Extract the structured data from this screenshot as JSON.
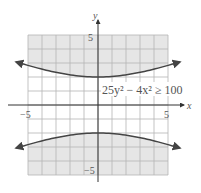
{
  "chart_data": {
    "type": "area",
    "title": "",
    "inequality": "25y² − 4x² ≥ 100",
    "equation_label": "25y² − 4x² ≥ 100",
    "curve": "hyperbola",
    "standard_form": "y²/4 − x²/25 ≥ 1",
    "vertices": [
      [
        0,
        2
      ],
      [
        0,
        -2
      ]
    ],
    "shaded_region": "above upper branch and below lower branch",
    "xlabel": "x",
    "ylabel": "y",
    "xlim": [
      -5,
      5
    ],
    "ylim": [
      -5,
      5
    ],
    "x_ticks_labeled": [
      "−5",
      "5"
    ],
    "y_ticks_labeled": [
      "5",
      "−5"
    ],
    "grid": true,
    "grid_step": 1,
    "colors": {
      "shade": "#e6e6e6",
      "grid": "#b4b4b4",
      "curve": "#444444",
      "axis": "#333333"
    }
  },
  "axes": {
    "x_label": "x",
    "y_label": "y",
    "x_min_label": "−5",
    "x_max_label": "5",
    "y_max_label": "5",
    "y_min_label": "−5"
  }
}
